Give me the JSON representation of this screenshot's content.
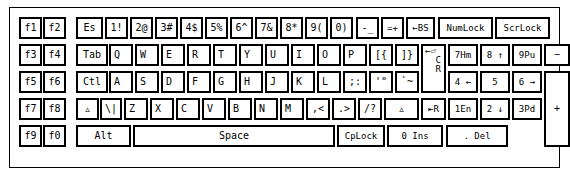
{
  "figure": {
    "background": "#ffffff",
    "ink": "#000000"
  },
  "keyboard": {
    "blocks": {
      "function_block": "function-keys",
      "main_block": "typewriter-keys",
      "numpad_block": "numeric-keypad"
    },
    "function_keys": [
      {
        "label": "f1"
      },
      {
        "label": "f2"
      },
      {
        "label": "f3"
      },
      {
        "label": "f4"
      },
      {
        "label": "f5"
      },
      {
        "label": "f6"
      },
      {
        "label": "f7"
      },
      {
        "label": "f8"
      },
      {
        "label": "f9"
      },
      {
        "label": "f0"
      }
    ],
    "row1": [
      {
        "label": "Es"
      },
      {
        "label": "1!"
      },
      {
        "label": "2@"
      },
      {
        "label": "3#"
      },
      {
        "label": "4$"
      },
      {
        "label": "5%"
      },
      {
        "label": "6^"
      },
      {
        "label": "7&"
      },
      {
        "label": "8*"
      },
      {
        "label": "9("
      },
      {
        "label": "0)"
      },
      {
        "label": "-_"
      },
      {
        "label": "=+"
      },
      {
        "label": "←BS"
      }
    ],
    "row1_locks": [
      {
        "label": "NumLock"
      },
      {
        "label": "ScrLock"
      }
    ],
    "row2": [
      {
        "label": "Tab"
      },
      {
        "label": "Q"
      },
      {
        "label": "W"
      },
      {
        "label": "E"
      },
      {
        "label": "R"
      },
      {
        "label": "T"
      },
      {
        "label": "Y"
      },
      {
        "label": "U"
      },
      {
        "label": "I"
      },
      {
        "label": "O"
      },
      {
        "label": "P"
      },
      {
        "label": "[{"
      },
      {
        "label": "]}"
      }
    ],
    "enter_key": {
      "line1": "←⏎",
      "line2": "C",
      "line3": "R"
    },
    "row3": [
      {
        "label": "Ctl"
      },
      {
        "label": "A"
      },
      {
        "label": "S"
      },
      {
        "label": "D"
      },
      {
        "label": "F"
      },
      {
        "label": "G"
      },
      {
        "label": "H"
      },
      {
        "label": "J"
      },
      {
        "label": "K"
      },
      {
        "label": "L"
      },
      {
        "label": ";:"
      },
      {
        "label": "'\""
      },
      {
        "label": "`~"
      }
    ],
    "row4": [
      {
        "label": "▵"
      },
      {
        "label": "\\|"
      },
      {
        "label": "Z"
      },
      {
        "label": "X"
      },
      {
        "label": "C"
      },
      {
        "label": "V"
      },
      {
        "label": "B"
      },
      {
        "label": "N"
      },
      {
        "label": "M"
      },
      {
        "label": ",<"
      },
      {
        "label": ".>"
      },
      {
        "label": "/?"
      },
      {
        "label": "▵"
      }
    ],
    "row4_shift_right": {
      "label": "⇤R"
    },
    "row5": [
      {
        "label": "Alt"
      },
      {
        "label": "Space"
      },
      {
        "label": "CpLock"
      }
    ],
    "numpad": {
      "row1": [
        {
          "label": "7Hm"
        },
        {
          "label": "8 ↑"
        },
        {
          "label": "9Pu"
        }
      ],
      "row2": [
        {
          "label": "4 ←"
        },
        {
          "label": "5"
        },
        {
          "label": "6 →"
        }
      ],
      "row3": [
        {
          "label": "1En"
        },
        {
          "label": "2 ↓"
        },
        {
          "label": "3Pd"
        }
      ],
      "row4": [
        {
          "label": "0 Ins"
        },
        {
          "label": ". Del"
        }
      ],
      "minus": {
        "label": "−"
      },
      "plus": {
        "label": "+"
      }
    }
  }
}
